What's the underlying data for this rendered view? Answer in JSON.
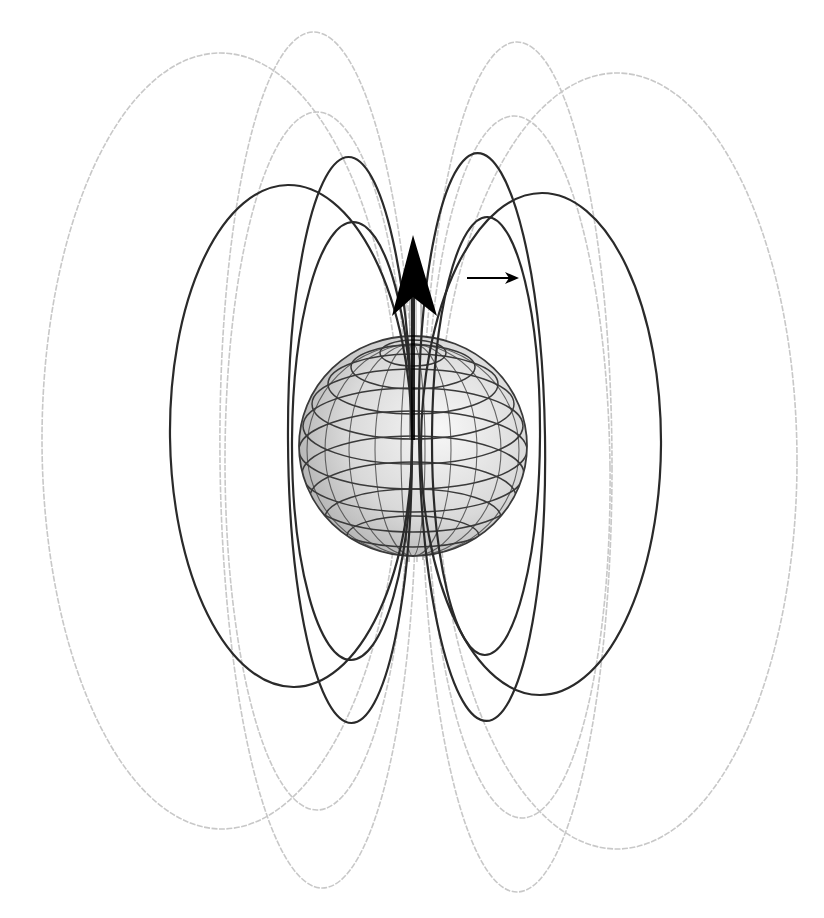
{
  "figure": {
    "width": 824,
    "height": 918,
    "background": "#ffffff"
  },
  "chart_data": {
    "type": "diagram",
    "colors": {
      "front_line": "#2a2a2a",
      "back_line": "#c8c8c8",
      "sphere_light": "#f4f4f4",
      "sphere_dark": "#a9a9a9",
      "grid": "#3a3a3a",
      "arrow": "#000000"
    },
    "sphere": {
      "cx": 413,
      "cy": 446,
      "rx": 114,
      "ry": 110
    },
    "pole_cap": {
      "cx": 413,
      "cy": 353,
      "rx": 33,
      "ry": 13
    },
    "latitude_rings": [
      {
        "cy": 353,
        "rx": 33,
        "ry": 13
      },
      {
        "cy": 367,
        "rx": 62,
        "ry": 22
      },
      {
        "cy": 384,
        "rx": 85,
        "ry": 30
      },
      {
        "cy": 404,
        "rx": 101,
        "ry": 35
      },
      {
        "cy": 426,
        "rx": 110,
        "ry": 38
      },
      {
        "cy": 450,
        "rx": 114,
        "ry": 39
      },
      {
        "cy": 474,
        "rx": 111,
        "ry": 38
      },
      {
        "cy": 497,
        "rx": 103,
        "ry": 35
      },
      {
        "cy": 518,
        "rx": 88,
        "ry": 29
      },
      {
        "cy": 536,
        "rx": 66,
        "ry": 20
      }
    ],
    "longitude_meridians": [
      {
        "rx": 12
      },
      {
        "rx": 38
      },
      {
        "rx": 64
      },
      {
        "rx": 88
      },
      {
        "rx": 106
      }
    ],
    "dipole_arrow": {
      "tip": [
        413,
        235
      ],
      "left_barb": [
        392,
        316
      ],
      "right_barb": [
        437,
        316
      ],
      "notch": [
        413,
        297
      ],
      "shaft_bottom": [
        413,
        440
      ],
      "shaft_width": 4
    },
    "direction_arrow": {
      "x1": 467,
      "y1": 278,
      "x2": 519,
      "y2": 278
    },
    "field_loops_front": [
      {
        "name": "left-wide",
        "cx": 291,
        "cy": 436,
        "rx": 121,
        "ry": 251,
        "rot": -0.7
      },
      {
        "name": "left-tall",
        "cx": 350,
        "cy": 440,
        "rx": 62,
        "ry": 283,
        "rot": -0.3
      },
      {
        "name": "left-short",
        "cx": 352,
        "cy": 441,
        "rx": 60,
        "ry": 219,
        "rot": 0.3
      },
      {
        "name": "right-wide",
        "cx": 541,
        "cy": 444,
        "rx": 120,
        "ry": 251,
        "rot": 0.3
      },
      {
        "name": "right-tall",
        "cx": 482,
        "cy": 437,
        "rx": 63,
        "ry": 284,
        "rot": -0.9
      },
      {
        "name": "right-short",
        "cx": 486,
        "cy": 436,
        "rx": 54,
        "ry": 219,
        "rot": 0.3
      }
    ],
    "field_loops_back": [
      {
        "name": "left-wide",
        "cx": 221,
        "cy": 441,
        "rx": 179,
        "ry": 388,
        "rot": -0.15
      },
      {
        "name": "left-tall",
        "cx": 318,
        "cy": 460,
        "rx": 98,
        "ry": 428,
        "rot": -0.6
      },
      {
        "name": "left-mid",
        "cx": 317,
        "cy": 461,
        "rx": 92,
        "ry": 349,
        "rot": 0
      },
      {
        "name": "right-wide",
        "cx": 617,
        "cy": 461,
        "rx": 180,
        "ry": 388,
        "rot": 0
      },
      {
        "name": "right-tall",
        "cx": 517,
        "cy": 467,
        "rx": 95,
        "ry": 425,
        "rot": 0
      },
      {
        "name": "right-mid",
        "cx": 518,
        "cy": 467,
        "rx": 92,
        "ry": 351,
        "rot": -0.7
      }
    ],
    "axis_lines": [
      {
        "x1": 406,
        "y1": 300,
        "x2": 404,
        "y2": 560
      },
      {
        "x1": 410,
        "y1": 296,
        "x2": 409,
        "y2": 562
      },
      {
        "x1": 416,
        "y1": 296,
        "x2": 417,
        "y2": 562
      },
      {
        "x1": 421,
        "y1": 300,
        "x2": 423,
        "y2": 560
      }
    ]
  }
}
